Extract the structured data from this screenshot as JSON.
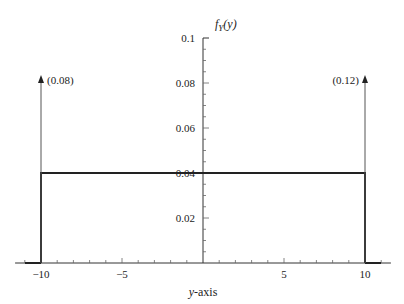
{
  "chart_data": {
    "type": "line",
    "title": "",
    "xlabel": "y-axis",
    "ylabel": "f_Y(y)",
    "ylabel_display": {
      "f": "f",
      "sub": "Y",
      "arg": "(y)"
    },
    "xlim": [
      -11.6,
      11.6
    ],
    "ylim": [
      0,
      0.1
    ],
    "x_ticks": [
      -10,
      -5,
      5,
      10
    ],
    "x_tick_labels": [
      "−10",
      "−5",
      "5",
      "10"
    ],
    "y_ticks": [
      0.02,
      0.04,
      0.06,
      0.08,
      0.1
    ],
    "y_tick_labels": [
      "0.02",
      "0.04",
      "0.06",
      "0.08",
      "0.1"
    ],
    "x_minor_step": 1,
    "y_minor_step": 0.005,
    "grid": false,
    "legend": null,
    "series": [
      {
        "name": "continuous density",
        "kind": "uniform",
        "x": [
          -10,
          -10,
          10,
          10
        ],
        "y": [
          0,
          0.04,
          0.04,
          0
        ]
      }
    ],
    "impulses": [
      {
        "x": -10,
        "mass": 0.08,
        "label": "(0.08)",
        "label_side": "right"
      },
      {
        "x": 10,
        "mass": 0.12,
        "label": "(0.12)",
        "label_side": "left"
      }
    ]
  }
}
